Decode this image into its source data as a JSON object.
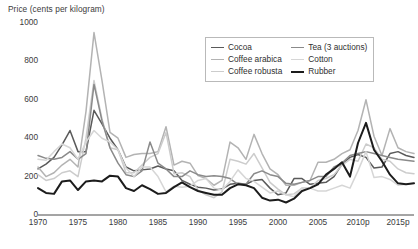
{
  "chart_data": {
    "type": "line",
    "title": "Price (cents per kilogram)",
    "xlabel": "",
    "ylabel": "Price (cents per kilogram)",
    "ylim": [
      0,
      1000
    ],
    "xlim": [
      1970,
      2017
    ],
    "yticks": [
      0,
      200,
      400,
      600,
      800,
      1000
    ],
    "xticks": [
      "1970",
      "1975",
      "1980",
      "1985",
      "1990",
      "1995",
      "2000",
      "2005",
      "2010p",
      "2015p"
    ],
    "xtick_values": [
      1970,
      1975,
      1980,
      1985,
      1990,
      1995,
      2000,
      2005,
      2010,
      2015
    ],
    "grid": false,
    "legend_position": "top-center-right",
    "x": [
      1970,
      1971,
      1972,
      1973,
      1974,
      1975,
      1976,
      1977,
      1978,
      1979,
      1980,
      1981,
      1982,
      1983,
      1984,
      1985,
      1986,
      1987,
      1988,
      1989,
      1990,
      1991,
      1992,
      1993,
      1994,
      1995,
      1996,
      1997,
      1998,
      1999,
      2000,
      2001,
      2002,
      2003,
      2004,
      2005,
      2006,
      2007,
      2008,
      2009,
      2010,
      2011,
      2012,
      2013,
      2014,
      2015,
      2016,
      2017
    ],
    "series": [
      {
        "name": "Cocoa",
        "color": "#5a5a5a",
        "width": 1.5,
        "values": [
          240,
          265,
          300,
          365,
          440,
          330,
          330,
          545,
          475,
          400,
          340,
          250,
          230,
          235,
          240,
          255,
          240,
          230,
          180,
          160,
          145,
          140,
          130,
          135,
          160,
          165,
          160,
          180,
          185,
          140,
          105,
          115,
          190,
          190,
          160,
          165,
          170,
          200,
          265,
          300,
          315,
          300,
          245,
          250,
          320,
          330,
          310,
          300
        ]
      },
      {
        "name": "Coffee arabica",
        "color": "#b3b3b3",
        "width": 1.5,
        "values": [
          250,
          200,
          220,
          260,
          290,
          250,
          540,
          950,
          700,
          430,
          400,
          300,
          315,
          320,
          320,
          330,
          460,
          260,
          280,
          270,
          205,
          190,
          155,
          180,
          380,
          350,
          290,
          420,
          320,
          240,
          210,
          155,
          155,
          170,
          180,
          275,
          275,
          290,
          320,
          340,
          440,
          600,
          410,
          310,
          450,
          350,
          330,
          320
        ]
      },
      {
        "name": "Coffee robusta",
        "color": "#cccccc",
        "width": 1.5,
        "values": [
          210,
          180,
          190,
          220,
          230,
          200,
          400,
          700,
          500,
          350,
          340,
          220,
          220,
          260,
          300,
          320,
          430,
          215,
          220,
          200,
          130,
          105,
          90,
          120,
          290,
          280,
          265,
          320,
          245,
          170,
          135,
          105,
          110,
          140,
          140,
          180,
          190,
          210,
          260,
          290,
          280,
          370,
          350,
          290,
          280,
          240,
          220,
          215
        ]
      },
      {
        "name": "Tea (3 auctions)",
        "color": "#8a8a8a",
        "width": 1.5,
        "values": [
          310,
          295,
          290,
          300,
          330,
          290,
          320,
          680,
          490,
          350,
          270,
          210,
          200,
          230,
          380,
          270,
          240,
          200,
          200,
          230,
          210,
          200,
          205,
          200,
          190,
          160,
          160,
          215,
          230,
          210,
          200,
          165,
          160,
          170,
          180,
          200,
          200,
          250,
          270,
          310,
          320,
          330,
          320,
          310,
          300,
          290,
          285,
          280
        ]
      },
      {
        "name": "Cotton",
        "color": "#d6d6d6",
        "width": 1.5,
        "values": [
          290,
          285,
          330,
          370,
          350,
          290,
          380,
          440,
          400,
          380,
          340,
          245,
          200,
          250,
          250,
          200,
          120,
          150,
          145,
          150,
          180,
          190,
          140,
          130,
          175,
          235,
          190,
          175,
          145,
          115,
          125,
          105,
          95,
          140,
          140,
          125,
          125,
          140,
          155,
          140,
          230,
          330,
          195,
          200,
          185,
          155,
          160,
          165
        ]
      },
      {
        "name": "Rubber",
        "color": "#1c1c1c",
        "width": 2.0,
        "values": [
          140,
          115,
          110,
          175,
          180,
          130,
          175,
          180,
          175,
          205,
          200,
          140,
          125,
          155,
          135,
          110,
          115,
          145,
          170,
          145,
          125,
          115,
          105,
          105,
          140,
          160,
          155,
          140,
          90,
          75,
          80,
          65,
          85,
          125,
          140,
          160,
          210,
          240,
          275,
          200,
          375,
          480,
          340,
          280,
          210,
          165,
          160,
          165
        ]
      }
    ]
  },
  "legend": {
    "items": [
      {
        "label": "Cocoa",
        "color": "#5a5a5a",
        "thickness": "1.6px"
      },
      {
        "label": "Coffee arabica",
        "color": "#b3b3b3",
        "thickness": "1.6px"
      },
      {
        "label": "Coffee robusta",
        "color": "#cccccc",
        "thickness": "1.6px"
      },
      {
        "label": "Tea (3 auctions)",
        "color": "#8a8a8a",
        "thickness": "1.6px"
      },
      {
        "label": "Cotton",
        "color": "#d6d6d6",
        "thickness": "1.6px"
      },
      {
        "label": "Rubber",
        "color": "#1c1c1c",
        "thickness": "2.2px"
      }
    ]
  }
}
